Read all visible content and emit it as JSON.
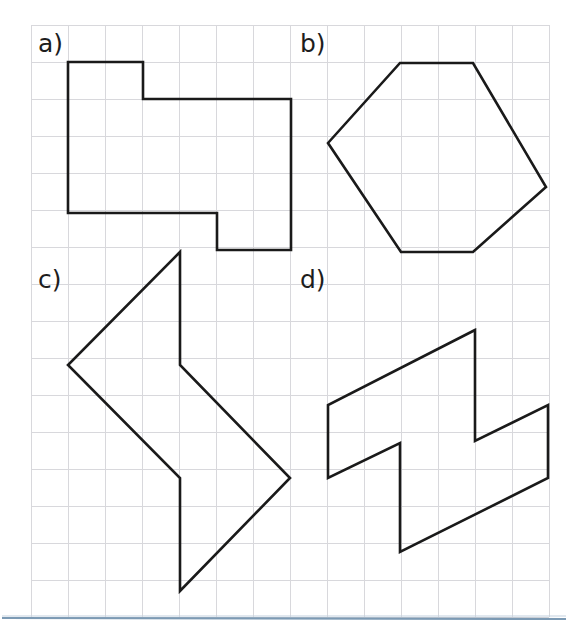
{
  "page": {
    "background_color": "#ffffff",
    "width": 570,
    "height": 632
  },
  "grid": {
    "color": "#d8d8dc",
    "origin_x": 31,
    "origin_y": 25,
    "cell_size": 37,
    "cols": 14,
    "rows": 16,
    "line_width": 1
  },
  "style": {
    "shape_stroke_color": "#1a1a1a",
    "shape_stroke_width": 2.6,
    "label_color": "#1d1d1d",
    "label_font_size": 25,
    "footer_rule_color": "#7c9ab4"
  },
  "labels": [
    {
      "id": "a",
      "text": "a)",
      "x": 38,
      "y": 52
    },
    {
      "id": "b",
      "text": "b)",
      "x": 300,
      "y": 52
    },
    {
      "id": "c",
      "text": "c)",
      "x": 38,
      "y": 288
    },
    {
      "id": "d",
      "text": "d)",
      "x": 300,
      "y": 288
    }
  ],
  "shapes": [
    {
      "id": "shape-a",
      "label": "a)",
      "name": "L-shaped-octagon",
      "closed": true,
      "points": [
        [
          68,
          62
        ],
        [
          143,
          62
        ],
        [
          143,
          99
        ],
        [
          291,
          99
        ],
        [
          291,
          250
        ],
        [
          217,
          250
        ],
        [
          217,
          213
        ],
        [
          68,
          213
        ]
      ]
    },
    {
      "id": "shape-b",
      "label": "b)",
      "name": "hexagon",
      "closed": true,
      "points": [
        [
          400,
          63
        ],
        [
          473,
          63
        ],
        [
          546,
          187
        ],
        [
          473,
          252
        ],
        [
          401,
          252
        ],
        [
          328,
          143
        ]
      ]
    },
    {
      "id": "shape-c",
      "label": "c)",
      "name": "arrow-zigzag-polygon",
      "closed": true,
      "points": [
        [
          180,
          252
        ],
        [
          180,
          591
        ],
        [
          290,
          478
        ],
        [
          180,
          365
        ]
      ],
      "outline_points": [
        [
          180,
          252
        ],
        [
          68,
          365
        ],
        [
          180,
          478
        ],
        [
          180,
          591
        ],
        [
          290,
          478
        ],
        [
          180,
          365
        ]
      ]
    },
    {
      "id": "shape-d",
      "label": "d)",
      "name": "z-shaped-parallelogram-polygon",
      "closed": true,
      "points": [
        [
          475,
          330
        ],
        [
          328,
          405
        ],
        [
          328,
          478
        ],
        [
          400,
          443
        ],
        [
          400,
          552
        ],
        [
          548,
          478
        ],
        [
          548,
          405
        ],
        [
          475,
          441
        ]
      ]
    }
  ],
  "footer": {
    "rule_y": 618,
    "rule_x_start": 2,
    "rule_x_end": 566
  }
}
